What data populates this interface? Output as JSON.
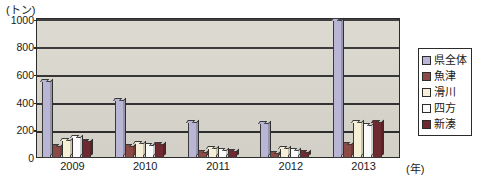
{
  "chart_data": {
    "type": "bar",
    "title": "",
    "subtitle": "",
    "unit_label": "(トン)",
    "xlabel": "(年)",
    "ylabel": "",
    "categories": [
      "2009",
      "2010",
      "2011",
      "2012",
      "2013"
    ],
    "ylim": [
      0,
      1000
    ],
    "yticks": [
      0,
      200,
      400,
      600,
      800,
      1000
    ],
    "ytick_labels": [
      "0",
      "200",
      "400",
      "600",
      "800",
      "1000"
    ],
    "grid": true,
    "legend_position": "right-outside",
    "series": [
      {
        "name": "県全体",
        "color": "#b8b6d4",
        "values": [
          560,
          420,
          260,
          255,
          1000
        ]
      },
      {
        "name": "魚津",
        "color": "#8c4a46",
        "values": [
          90,
          90,
          40,
          35,
          100
        ]
      },
      {
        "name": "滑川",
        "color": "#f4efd6",
        "values": [
          130,
          110,
          75,
          70,
          260
        ]
      },
      {
        "name": "四方",
        "color": "#fbfbfb",
        "values": [
          155,
          95,
          60,
          55,
          240
        ]
      },
      {
        "name": "新湊",
        "color": "#6e2a30",
        "values": [
          125,
          100,
          50,
          45,
          260
        ]
      }
    ]
  },
  "legend": {
    "items": [
      {
        "label": "県全体",
        "color": "#b8b6d4"
      },
      {
        "label": "魚津",
        "color": "#8c4a46"
      },
      {
        "label": "滑川",
        "color": "#f4efd6"
      },
      {
        "label": "四方",
        "color": "#fbfbfb"
      },
      {
        "label": "新湊",
        "color": "#6e2a30"
      }
    ]
  },
  "colors": {
    "plot_background": "#d9d6cd",
    "axis": "#2b2b2b",
    "page_background": "#ffffff"
  }
}
